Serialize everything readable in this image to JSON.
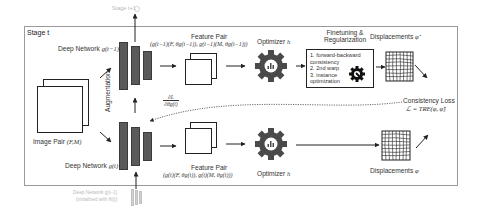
{
  "diagram": {
    "stage_label": "Stage t",
    "top_faded_output": "Stage t+1",
    "image_pair": {
      "label": "Image Pair",
      "math": "(F,M)"
    },
    "augmentation_label": "Augmentation",
    "deep_network_top": {
      "label": "Deep Network",
      "math": "g(t−1)"
    },
    "deep_network_bottom": {
      "label": "Deep Network",
      "math": "g(t)"
    },
    "faded_prev_network": {
      "line1": "Deep Network g(t−1)",
      "line2": "(initialized with θ(t))"
    },
    "feature_pair_top": {
      "label": "Feature Pair",
      "math": "(g(t−1)(F, θg(t−1)), g(t−1)(M, θg(t−1)))"
    },
    "feature_pair_bottom": {
      "label": "Feature Pair",
      "math": "(g(t)(F, θg(t)), g(t)(M, θg(t)))"
    },
    "optimizer_top": {
      "label": "Optimizer",
      "math": "h"
    },
    "optimizer_bottom": {
      "label": "Optimizer",
      "math": "h"
    },
    "finetuning": {
      "title_line1": "Finetuning &",
      "title_line2": "Regularization",
      "items": [
        "1.  forward-backward",
        "     consistency",
        "2.  2nd warp",
        "3.  instance",
        "     optimization"
      ]
    },
    "displacements_top": {
      "label": "Displacements",
      "math": "φ̂"
    },
    "displacements_bottom": {
      "label": "Displacements",
      "math": "φ"
    },
    "consistency_loss": {
      "label": "Consistency Loss",
      "math": "ℒ = TRE(φ, φ̂)"
    },
    "gradient": {
      "numerator": "∂L",
      "denominator": "∂θg(t)"
    },
    "colors": {
      "network_bar": "#5a5a5a",
      "gear": "#4a4a4a",
      "frame": "#9a9a9a",
      "faded": "#c8c8c8"
    }
  }
}
